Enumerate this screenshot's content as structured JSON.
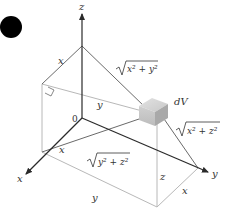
{
  "diagram": {
    "colors": {
      "axis": "#2a2a2a",
      "edge_light": "#b8b8b8",
      "distance_line": "#6a6a6a",
      "bullet": "#000000",
      "box_top": "#d6d6d6",
      "box_front": "#c2c2c2",
      "box_side": "#a8a8a8"
    },
    "axes": {
      "z_label": "z",
      "y_label": "y",
      "x_label": "x",
      "origin_label": "0"
    },
    "element": {
      "label": "dV"
    },
    "edge_labels": {
      "top_x": "x",
      "top_y": "y",
      "bottom_x_axis_x": "x",
      "bottom_y": "y",
      "right_z": "z",
      "right_x": "x"
    },
    "distance_labels": {
      "to_z_axis": "x² + y²",
      "to_y_axis": "x² + z²",
      "to_x_axis": "y² + z²"
    }
  }
}
